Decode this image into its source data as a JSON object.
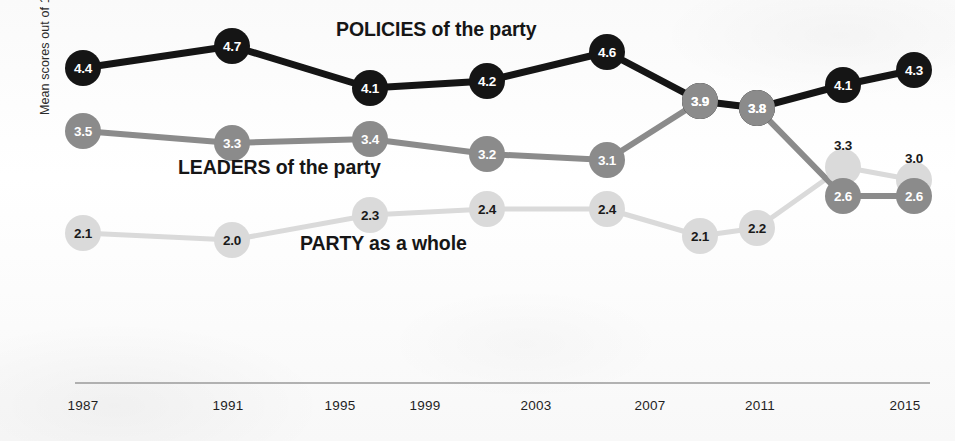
{
  "axes": {
    "y_title": "Mean scores out of 10",
    "x_ticks": [
      "1987",
      "1991",
      "1995",
      "1999",
      "2003",
      "2007",
      "2011",
      "2015"
    ]
  },
  "annotations": {
    "policies": {
      "keyword": "POLICIES",
      "rest": " of the party"
    },
    "leaders": {
      "keyword": "LEADERS",
      "rest": " of the party"
    },
    "party": {
      "keyword": "PARTY",
      "rest": " as a whole"
    }
  },
  "colors": {
    "policies": "#151515",
    "leaders": "#8b8b8b",
    "party": "#dadada",
    "axis": "#9a9a9a",
    "text": "#1a1a1a"
  },
  "chart_data": {
    "type": "line",
    "title": "",
    "xlabel": "",
    "ylabel": "Mean scores out of 10",
    "xlim": [
      1986,
      2016
    ],
    "ylim": [
      0,
      10
    ],
    "grid": false,
    "legend": "inline-annotations",
    "x_tick_labels": [
      "1987",
      "1991",
      "1995",
      "1999",
      "2003",
      "2007",
      "2011",
      "2015"
    ],
    "series": [
      {
        "name": "POLICIES of the party",
        "color": "#151515",
        "x": [
          1987,
          1991,
          1997,
          2001,
          2005,
          2007,
          2010,
          2012,
          2015
        ],
        "values": [
          4.4,
          4.7,
          4.1,
          4.2,
          4.6,
          3.9,
          3.8,
          4.1,
          4.3
        ],
        "labels": [
          "4.4",
          "4.7",
          "4.1",
          "4.2",
          "4.6",
          "3.9",
          "3.8",
          "4.1",
          "4.3"
        ]
      },
      {
        "name": "LEADERS of the party",
        "color": "#8b8b8b",
        "x": [
          1987,
          1991,
          1997,
          2001,
          2005,
          2007,
          2010,
          2012,
          2015
        ],
        "values": [
          3.5,
          3.3,
          3.4,
          3.2,
          3.1,
          3.9,
          3.8,
          2.6,
          2.6
        ],
        "labels": [
          "3.5",
          "3.3",
          "3.4",
          "3.2",
          "3.1",
          "3.9",
          "3.8",
          "2.6",
          "2.6"
        ]
      },
      {
        "name": "PARTY as a whole",
        "color": "#dadada",
        "x": [
          1987,
          1991,
          1997,
          2001,
          2005,
          2007,
          2010,
          2012,
          2015
        ],
        "values": [
          2.1,
          2.0,
          2.3,
          2.4,
          2.4,
          2.1,
          2.2,
          3.3,
          3.0
        ],
        "labels": [
          "2.1",
          "2.0",
          "2.3",
          "2.4",
          "2.4",
          "2.1",
          "2.2",
          "3.3",
          "3.0"
        ]
      }
    ]
  },
  "geometry": {
    "tick_x": [
      83,
      228,
      340,
      425,
      536,
      650,
      760,
      905
    ],
    "points": {
      "policies": [
        {
          "x": 83,
          "y": 68,
          "label": "4.4",
          "inside": true
        },
        {
          "x": 232,
          "y": 46,
          "label": "4.7",
          "inside": true
        },
        {
          "x": 370,
          "y": 88,
          "label": "4.1",
          "inside": true
        },
        {
          "x": 487,
          "y": 81,
          "label": "4.2",
          "inside": true
        },
        {
          "x": 607,
          "y": 52,
          "label": "4.6",
          "inside": true
        },
        {
          "x": 700,
          "y": 101,
          "label": "3.9",
          "inside": true
        },
        {
          "x": 757,
          "y": 108,
          "label": "3.8",
          "inside": true
        },
        {
          "x": 843,
          "y": 85,
          "label": "4.1",
          "inside": true
        },
        {
          "x": 914,
          "y": 70,
          "label": "4.3",
          "inside": true
        }
      ],
      "leaders": [
        {
          "x": 83,
          "y": 131,
          "label": "3.5",
          "inside": true
        },
        {
          "x": 232,
          "y": 143,
          "label": "3.3",
          "inside": true
        },
        {
          "x": 370,
          "y": 139,
          "label": "3.4",
          "inside": true
        },
        {
          "x": 487,
          "y": 154,
          "label": "3.2",
          "inside": true
        },
        {
          "x": 607,
          "y": 160,
          "label": "3.1",
          "inside": true
        },
        {
          "x": 700,
          "y": 101,
          "label": "3.9",
          "inside": true
        },
        {
          "x": 757,
          "y": 108,
          "label": "3.8",
          "inside": true
        },
        {
          "x": 843,
          "y": 196,
          "label": "2.6",
          "inside": true
        },
        {
          "x": 914,
          "y": 196,
          "label": "2.6",
          "inside": true
        }
      ],
      "party": [
        {
          "x": 83,
          "y": 233,
          "label": "2.1",
          "inside": true
        },
        {
          "x": 232,
          "y": 240,
          "label": "2.0",
          "inside": true
        },
        {
          "x": 370,
          "y": 215,
          "label": "2.3",
          "inside": true
        },
        {
          "x": 487,
          "y": 209,
          "label": "2.4",
          "inside": true
        },
        {
          "x": 607,
          "y": 209,
          "label": "2.4",
          "inside": true
        },
        {
          "x": 700,
          "y": 236,
          "label": "2.1",
          "inside": true
        },
        {
          "x": 757,
          "y": 228,
          "label": "2.2",
          "inside": true
        },
        {
          "x": 843,
          "y": 167,
          "label": "3.3",
          "inside": false,
          "label_dx": 0,
          "label_dy": -22
        },
        {
          "x": 914,
          "y": 180,
          "label": "3.0",
          "inside": false,
          "label_dx": 0,
          "label_dy": -22
        }
      ]
    },
    "axis_line": {
      "x1": 75,
      "x2": 930,
      "y": 383
    }
  }
}
